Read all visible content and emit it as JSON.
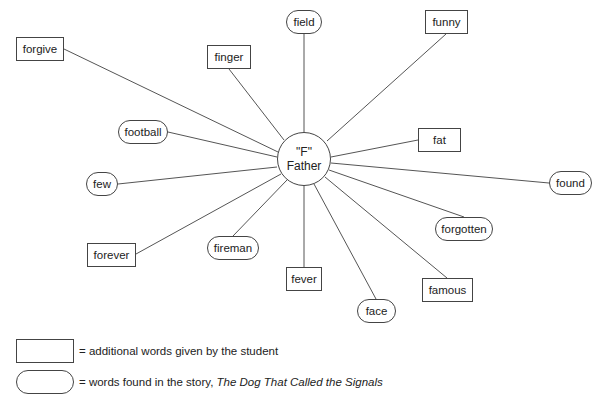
{
  "center": {
    "line1": "\"F\"",
    "line2": "Father",
    "x": 304,
    "y": 159,
    "r": 27
  },
  "nodes": [
    {
      "label": "forgive",
      "shape": "box",
      "x": 16,
      "y": 37,
      "w": 48,
      "h": 24
    },
    {
      "label": "finger",
      "shape": "box",
      "x": 207,
      "y": 45,
      "w": 44,
      "h": 24
    },
    {
      "label": "field",
      "shape": "oval",
      "x": 286,
      "y": 10,
      "w": 36,
      "h": 24
    },
    {
      "label": "funny",
      "shape": "box",
      "x": 425,
      "y": 10,
      "w": 43,
      "h": 24
    },
    {
      "label": "football",
      "shape": "oval",
      "x": 118,
      "y": 120,
      "w": 50,
      "h": 24
    },
    {
      "label": "fat",
      "shape": "box",
      "x": 418,
      "y": 128,
      "w": 43,
      "h": 24
    },
    {
      "label": "few",
      "shape": "oval",
      "x": 86,
      "y": 172,
      "w": 32,
      "h": 24
    },
    {
      "label": "found",
      "shape": "oval",
      "x": 549,
      "y": 171,
      "w": 43,
      "h": 24
    },
    {
      "label": "forever",
      "shape": "box",
      "x": 87,
      "y": 243,
      "w": 49,
      "h": 24
    },
    {
      "label": "fireman",
      "shape": "oval",
      "x": 207,
      "y": 236,
      "w": 52,
      "h": 24
    },
    {
      "label": "forgotten",
      "shape": "oval",
      "x": 435,
      "y": 217,
      "w": 58,
      "h": 24
    },
    {
      "label": "fever",
      "shape": "box",
      "x": 286,
      "y": 267,
      "w": 36,
      "h": 24
    },
    {
      "label": "famous",
      "shape": "box",
      "x": 422,
      "y": 278,
      "w": 51,
      "h": 24
    },
    {
      "label": "face",
      "shape": "oval",
      "x": 357,
      "y": 299,
      "w": 39,
      "h": 24
    }
  ],
  "edges": [
    {
      "to": "forgive",
      "x1": 278,
      "y1": 152,
      "x2": 64,
      "y2": 49
    },
    {
      "to": "finger",
      "x1": 284,
      "y1": 140,
      "x2": 229,
      "y2": 69
    },
    {
      "to": "field",
      "x1": 304,
      "y1": 132,
      "x2": 304,
      "y2": 34
    },
    {
      "to": "funny",
      "x1": 327,
      "y1": 141,
      "x2": 446,
      "y2": 34
    },
    {
      "to": "football",
      "x1": 277,
      "y1": 157,
      "x2": 168,
      "y2": 132
    },
    {
      "to": "fat",
      "x1": 331,
      "y1": 157,
      "x2": 418,
      "y2": 140
    },
    {
      "to": "few",
      "x1": 277,
      "y1": 167,
      "x2": 118,
      "y2": 184
    },
    {
      "to": "found",
      "x1": 331,
      "y1": 163,
      "x2": 549,
      "y2": 183
    },
    {
      "to": "forever",
      "x1": 281,
      "y1": 174,
      "x2": 136,
      "y2": 254
    },
    {
      "to": "fireman",
      "x1": 287,
      "y1": 180,
      "x2": 233,
      "y2": 236
    },
    {
      "to": "forgotten",
      "x1": 329,
      "y1": 170,
      "x2": 464,
      "y2": 217
    },
    {
      "to": "fever",
      "x1": 304,
      "y1": 186,
      "x2": 304,
      "y2": 267
    },
    {
      "to": "famous",
      "x1": 325,
      "y1": 177,
      "x2": 447,
      "y2": 278
    },
    {
      "to": "face",
      "x1": 314,
      "y1": 184,
      "x2": 376,
      "y2": 299
    }
  ],
  "legend": {
    "box_text": "= additional words given by the student",
    "oval_text_prefix": "= words found in the story, ",
    "oval_text_title": "The Dog That Called the Signals"
  },
  "colors": {
    "line": "#555555",
    "border": "#444444",
    "text": "#222222"
  }
}
